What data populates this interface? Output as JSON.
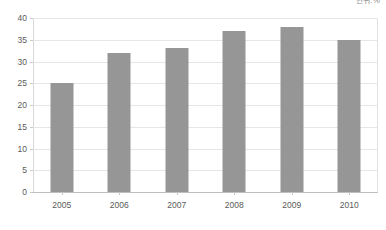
{
  "annotation": {
    "unit_note": "단위:%"
  },
  "chart_data": {
    "type": "bar",
    "title": "",
    "subtitle": "",
    "xlabel": "",
    "ylabel": "",
    "categories": [
      "2005",
      "2006",
      "2007",
      "2008",
      "2009",
      "2010"
    ],
    "values": [
      25,
      32,
      33,
      37,
      38,
      35
    ],
    "series": [
      {
        "name": "",
        "values": [
          25,
          32,
          33,
          37,
          38,
          35
        ],
        "color": "#969696"
      }
    ],
    "ylim": [
      0,
      40
    ],
    "ytick_step": 5,
    "yticks": [
      0,
      5,
      10,
      15,
      20,
      25,
      30,
      35,
      40
    ],
    "ytick_labels": [
      "0",
      "5",
      "10",
      "15",
      "20",
      "25",
      "30",
      "35",
      "40"
    ],
    "grid": true,
    "grid_axis": "y",
    "legend": false,
    "legend_position": "none",
    "data_labels": false,
    "bar_color": "#969696",
    "gridline_color": "#e6e6e6",
    "axis_color": "#bfbfbf",
    "background": "#ffffff",
    "text_color": "#5a5a5a"
  }
}
